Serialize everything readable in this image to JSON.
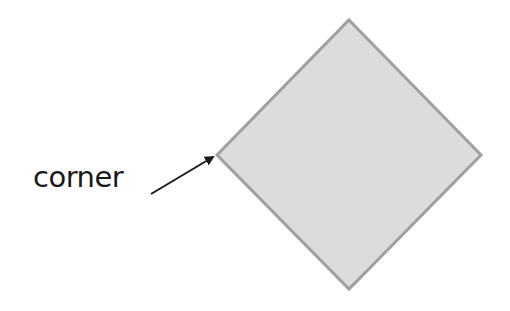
{
  "diagram": {
    "shape": "diamond",
    "fill": "#dcdcdc",
    "stroke": "#a0a0a0",
    "label": "corner",
    "arrow_color": "#1a1a1a"
  }
}
